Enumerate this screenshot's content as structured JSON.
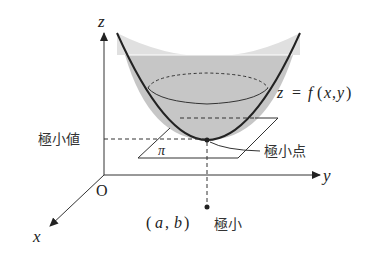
{
  "diagram": {
    "axes": {
      "z_label": "z",
      "y_label": "y",
      "x_label": "x",
      "origin_label": "O"
    },
    "surface_label": "z = f (x, y)",
    "surface_label_parts": {
      "z": "z",
      "eq": "=",
      "f": "f",
      "open": "(",
      "x": "x",
      "comma": ",",
      "y": "y",
      "close": ")"
    },
    "plane_label": "π",
    "min_value_label": "極小値",
    "min_point_label": "極小点",
    "point_label": "(a, b)",
    "point_label_parts": {
      "open": "(",
      "a": "a",
      "comma": ",",
      "b": "b",
      "close": ")"
    },
    "min_label": "極小",
    "colors": {
      "line": "#222222",
      "surface_fill": "#c4c4c4",
      "surface_fill_top": "#dcdcdc"
    }
  }
}
